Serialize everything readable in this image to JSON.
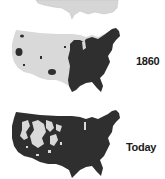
{
  "maps": [
    {
      "id": "map-top-partial",
      "label": "",
      "fill_light": "#d6d6d6"
    },
    {
      "id": "map-1860",
      "label": "1860",
      "fill_light": "#d9d9d9",
      "fill_dark": "#2f2f2f"
    },
    {
      "id": "map-today",
      "label": "Today",
      "fill_light": "#d9d9d9",
      "fill_dark": "#2f2f2f"
    }
  ],
  "colors": {
    "background": "#ffffff",
    "unsettled": "#d9d9d9",
    "settled": "#2f2f2f",
    "label": "#1a1a1a"
  }
}
